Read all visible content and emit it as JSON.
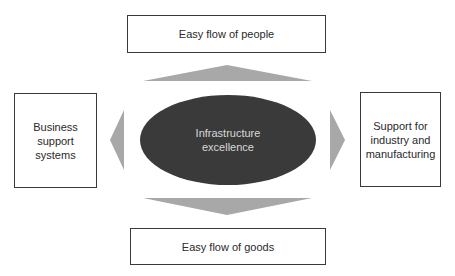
{
  "diagram": {
    "center": {
      "label_line1": "Infrastructure",
      "label_line2": "excellence",
      "fill": "#3a3a3a"
    },
    "top_box": {
      "label": "Easy flow of people"
    },
    "bottom_box": {
      "label": "Easy flow of goods"
    },
    "left_box": {
      "line1": "Business",
      "line2": "support",
      "line3": "systems"
    },
    "right_box": {
      "line1": "Support for",
      "line2": "industry and",
      "line3": "manufacturing"
    },
    "arrow_color": "#a8a8a8"
  }
}
